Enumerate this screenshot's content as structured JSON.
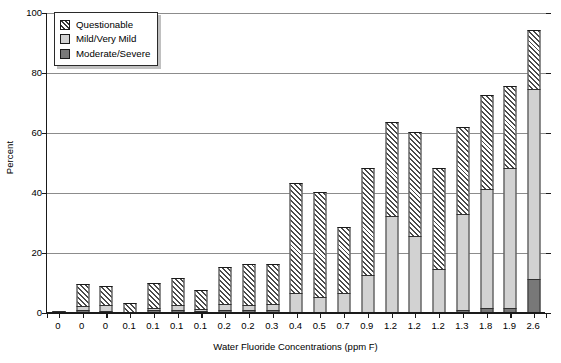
{
  "chart_data": {
    "type": "bar",
    "stacked": true,
    "title": "",
    "xlabel": "Water Fluoride Concentrations (ppm F)",
    "ylabel": "Percent",
    "ylim": [
      0,
      100
    ],
    "yticks": [
      0,
      20,
      40,
      60,
      80,
      100
    ],
    "grid": true,
    "legend_position": "top-left",
    "categories": [
      "0",
      "0",
      "0",
      "0.1",
      "0.1",
      "0.1",
      "0.1",
      "0.2",
      "0.2",
      "0.3",
      "0.4",
      "0.5",
      "0.7",
      "0.9",
      "1.2",
      "1.2",
      "1.2",
      "1.3",
      "1.8",
      "1.9",
      "2.6"
    ],
    "series": [
      {
        "name": "Moderate/Severe",
        "color": "#787878",
        "values": [
          0.5,
          0.6,
          0.5,
          0.0,
          0.6,
          0.6,
          0.5,
          0.6,
          0.7,
          0.6,
          0.0,
          0.0,
          0.0,
          0.0,
          0.0,
          0.0,
          0.0,
          0.7,
          1.5,
          1.5,
          11.0
        ]
      },
      {
        "name": "Mild/Very Mild",
        "color": "#d2d2d2",
        "values": [
          0.0,
          1.4,
          2.0,
          0.0,
          0.8,
          1.6,
          0.6,
          2.0,
          1.5,
          2.0,
          6.5,
          5.0,
          6.5,
          12.5,
          32.0,
          25.5,
          14.5,
          32.0,
          39.5,
          46.5,
          63.5
        ]
      },
      {
        "name": "Questionable",
        "color": "#ffffff",
        "hatch": "diagonal",
        "values": [
          0.0,
          7.5,
          6.3,
          3.0,
          8.4,
          9.3,
          6.2,
          12.4,
          13.8,
          13.4,
          36.5,
          35.0,
          22.0,
          35.5,
          31.5,
          34.5,
          33.5,
          29.0,
          31.5,
          27.5,
          19.5
        ]
      }
    ],
    "totals": [
      0.5,
      9.5,
      8.8,
      3.0,
      9.8,
      11.5,
      7.3,
      15.0,
      16.0,
      16.0,
      43.0,
      40.0,
      28.5,
      48.0,
      63.5,
      60.0,
      48.0,
      61.7,
      72.5,
      75.5,
      94.0
    ]
  },
  "legend": {
    "items": [
      {
        "label": "Questionable",
        "swatch": "hatched-swatch"
      },
      {
        "label": "Mild/Very Mild",
        "swatch": "light-gray-swatch"
      },
      {
        "label": "Moderate/Severe",
        "swatch": "dark-gray-swatch"
      }
    ]
  }
}
